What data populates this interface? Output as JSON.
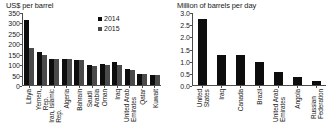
{
  "chart_data": [
    {
      "type": "bar",
      "panel": "left",
      "title": "US$ per barrel",
      "xlabel": "",
      "ylabel": "",
      "ylim": [
        0,
        350
      ],
      "yticks": [
        350,
        300,
        250,
        200,
        150,
        100,
        50,
        0
      ],
      "grid": false,
      "legend_position": "top-right",
      "categories": [
        "Libya",
        "Yemen, Rep.",
        "Iran, Islamic Rep.",
        "Algeria",
        "Bahrain",
        "Saudi Arabia",
        "Oman",
        "Iraq",
        "United Arab Emirates",
        "Qatar",
        "Kuwait"
      ],
      "series": [
        {
          "name": "2014",
          "color": "#0d0d0d",
          "values": [
            315,
            160,
            128,
            127,
            124,
            97,
            100,
            110,
            78,
            55,
            50
          ]
        },
        {
          "name": "2015",
          "color": "#4a4a4a",
          "values": [
            180,
            145,
            128,
            125,
            124,
            93,
            99,
            97,
            75,
            54,
            48
          ]
        }
      ]
    },
    {
      "type": "bar",
      "panel": "right",
      "title": "Million of barrels per day",
      "xlabel": "",
      "ylabel": "",
      "ylim": [
        0.0,
        3.0
      ],
      "yticks": [
        "3.0",
        "2.5",
        "2.0",
        "1.5",
        "1.0",
        "0.5",
        "0.0"
      ],
      "grid": false,
      "legend_position": "none",
      "categories": [
        "United States",
        "Iraq",
        "Canada",
        "Brazil",
        "United Arab Emirates",
        "Angola",
        "Russian Federation"
      ],
      "series": [
        {
          "name": "production",
          "color": "#0d0d0d",
          "values": [
            2.75,
            1.27,
            1.23,
            0.97,
            0.53,
            0.35,
            0.15
          ]
        }
      ]
    }
  ],
  "legend": {
    "items": [
      {
        "label": "2014",
        "color": "#0d0d0d"
      },
      {
        "label": "2015",
        "color": "#4a4a4a"
      }
    ]
  },
  "colors": {
    "series_2014": "#0d0d0d",
    "series_2015": "#4a4a4a",
    "axis": "#4d4d4d",
    "text": "#1a1a1a",
    "background": "#ffffff"
  }
}
